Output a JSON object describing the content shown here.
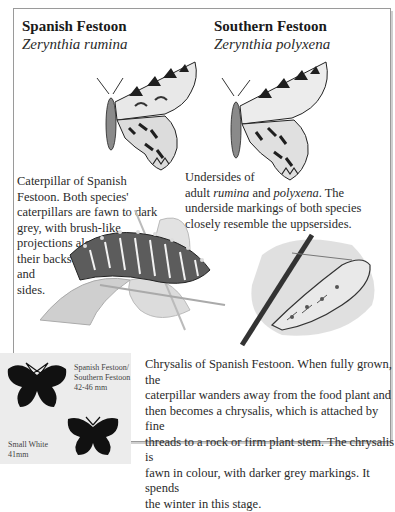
{
  "species": [
    {
      "common_name": "Spanish Festoon",
      "latin_name": "Zerynthia rumina"
    },
    {
      "common_name": "Southern Festoon",
      "latin_name": "Zerynthia polyxena"
    }
  ],
  "captions": {
    "caterpillar": {
      "lines": [
        "Caterpillar of Spanish",
        "Festoon. Both species'",
        "caterpillars are fawn to dark",
        "grey, with brush-like",
        "projections along",
        "their backs",
        "and",
        "sides."
      ]
    },
    "undersides": {
      "line1": "Undersides of",
      "line2_pre": "adult ",
      "line2_em1": "rumina",
      "line2_mid": " and ",
      "line2_em2": "polyxena",
      "line2_post": ". The",
      "line3": "underside markings of both species",
      "line4": "closely resemble the uppsersides."
    },
    "chrysalis": {
      "lines": [
        "Chrysalis of Spanish Festoon. When fully grown, the",
        "caterpillar wanders away from the food plant and",
        "then becomes a chrysalis, which is attached by fine",
        "threads to a rock or firm plant stem. The chrysalis is",
        "fawn in colour, with darker grey markings. It spends",
        "the winter in this stage."
      ]
    }
  },
  "size_comparison": {
    "festoon": {
      "label_line1": "Spanish Festoon/",
      "label_line2": "Southern Festoon",
      "size": "42-46 mm"
    },
    "small_white": {
      "label": "Small White",
      "size": "41mm"
    }
  },
  "illustrations": {
    "butterfly_left": "spanish-festoon-underside",
    "butterfly_right": "southern-festoon-underside",
    "caterpillar": "spanish-festoon-caterpillar",
    "chrysalis": "spanish-festoon-chrysalis"
  }
}
